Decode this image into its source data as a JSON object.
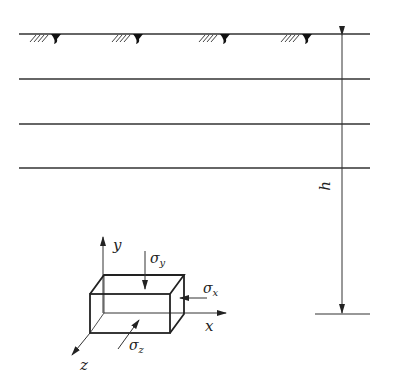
{
  "diagram": {
    "title": "",
    "type": "soil element stress diagram",
    "ground_surface": {
      "symbol": "water-table / ground markers",
      "count": 4
    },
    "layer_lines": 4,
    "dimension": {
      "label": "h"
    },
    "axes": {
      "x": "x",
      "y": "y",
      "z": "z"
    },
    "stresses": {
      "sigma_x": "σx",
      "sigma_y": "σy",
      "sigma_z": "σz"
    },
    "labels": {
      "h": "h",
      "x": "x",
      "y": "y",
      "z": "z",
      "sigma": "σ",
      "sub_x": "x",
      "sub_y": "y",
      "sub_z": "z"
    },
    "colors": {
      "line": "#222222",
      "background": "#ffffff"
    }
  }
}
